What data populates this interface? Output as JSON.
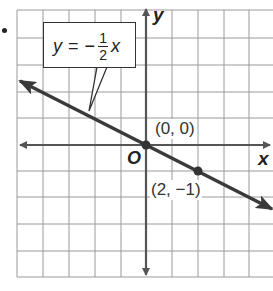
{
  "figure": {
    "equation": {
      "lhs": "y",
      "equals": "=",
      "sign": "−",
      "numerator": "1",
      "denominator": "2",
      "variable": "x"
    },
    "axes": {
      "x_label": "x",
      "y_label": "y",
      "origin_label": "O"
    },
    "points": [
      {
        "label": "(0, 0)",
        "x": 0,
        "y": 0
      },
      {
        "label": "(2, −1)",
        "x": 2,
        "y": -1
      }
    ],
    "grid": {
      "x_range": [
        -5,
        5
      ],
      "y_range": [
        -5,
        5
      ],
      "spacing_units": 1
    },
    "colors": {
      "line": "#3a3a3a",
      "axes": "#555555",
      "grid": "#9a9a9a"
    }
  }
}
